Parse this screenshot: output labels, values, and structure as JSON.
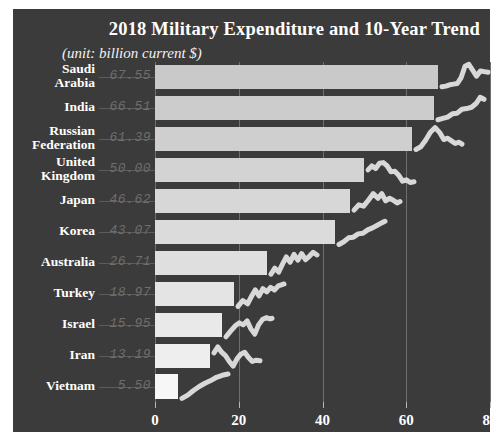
{
  "figure": {
    "title": "2018 Military Expenditure and 10-Year Trend",
    "subtitle": "(unit: billion current $)",
    "background_color": "#3b3b3b",
    "text_color": "#ffffff",
    "gridline_color": "#6f6f6f",
    "value_label_color": "#6e6e6e",
    "sparkline_color": "#d8d8d8"
  },
  "chart_data": {
    "type": "bar",
    "title": "2018 Military Expenditure and 10-Year Trend",
    "subtitle": "(unit: billion current $)",
    "xlabel": "",
    "ylabel": "",
    "unit": "billion current $",
    "orientation": "horizontal",
    "grid": true,
    "legend": "none",
    "xlim": [
      0,
      80
    ],
    "xticks": [
      0,
      20,
      40,
      60,
      80
    ],
    "xticklabels": [
      "0",
      "20",
      "40",
      "60",
      "80"
    ],
    "categories": [
      "Saudi Arabia",
      "India",
      "Russian Federation",
      "United Kingdom",
      "Japan",
      "Korea",
      "Australia",
      "Turkey",
      "Israel",
      "Iran",
      "Vietnam"
    ],
    "values": [
      67.55,
      66.51,
      61.39,
      50.0,
      46.62,
      43.07,
      26.71,
      18.97,
      15.95,
      13.19,
      5.5
    ],
    "value_labels": [
      "67.55",
      "66.51",
      "61.39",
      "50.00",
      "46.62",
      "43.07",
      "26.71",
      "18.97",
      "15.95",
      "13.19",
      "5.50"
    ],
    "bar_colors": [
      "#c9c9c9",
      "#cccccc",
      "#cfcfcf",
      "#d3d3d3",
      "#d7d7d7",
      "#dbdbdb",
      "#dfdfdf",
      "#e4e4e4",
      "#e9e9e9",
      "#eeeeee",
      "#f7f7f7"
    ],
    "sparklines": [
      {
        "country": "Saudi Arabia",
        "points": "0,72 8,70 16,66 24,64 32,62 40,44 48,10 56,4 64,22 72,40 80,24 88,26 96,28"
      },
      {
        "country": "India",
        "points": "0,78 10,74 20,70 30,60 40,58 50,46 60,44 70,40 80,28 88,10 96,16"
      },
      {
        "country": "Russian Federation",
        "points": "0,74 10,66 20,46 30,22 40,8 50,24 58,44 66,40 74,48 82,56 90,52 96,58"
      },
      {
        "country": "United Kingdom",
        "points": "0,42 8,30 16,38 24,22 32,20 40,30 48,48 56,46 64,58 72,76 80,72 88,80 96,78"
      },
      {
        "country": "Japan",
        "points": "0,70 10,54 20,58 30,40 40,20 50,34 58,20 66,42 74,34 82,40 90,48 96,44"
      },
      {
        "country": "Korea",
        "points": "0,80 10,72 20,60 30,58 40,48 50,46 60,36 70,30 80,22 90,14 96,10"
      },
      {
        "country": "Australia",
        "points": "0,76 8,58 16,70 24,46 32,24 40,40 48,16 56,34 64,14 72,32 80,22 88,10 96,18"
      },
      {
        "country": "Turkey",
        "points": "0,80 10,62 20,72 28,50 36,30 44,48 52,26 60,36 68,22 76,30 84,18 92,14 96,12"
      },
      {
        "country": "Israel",
        "points": "0,78 10,60 20,44 28,36 36,42 44,30 52,54 60,70 68,42 76,26 84,20 92,24 96,22"
      },
      {
        "country": "Iran",
        "points": "0,36 8,18 16,34 24,44 32,62 40,76 48,54 56,40 64,34 72,50 80,62 88,58 96,60"
      },
      {
        "country": "Vietnam",
        "points": "0,80 12,70 24,56 36,44 48,34 60,26 72,16 84,10 96,6"
      }
    ]
  },
  "rows": [
    {
      "label_line1": "Saudi",
      "label_line2": "Arabia"
    },
    {
      "label_line1": "India",
      "label_line2": ""
    },
    {
      "label_line1": "Russian",
      "label_line2": "Federation"
    },
    {
      "label_line1": "United",
      "label_line2": "Kingdom"
    },
    {
      "label_line1": "Japan",
      "label_line2": ""
    },
    {
      "label_line1": "Korea",
      "label_line2": ""
    },
    {
      "label_line1": "Australia",
      "label_line2": ""
    },
    {
      "label_line1": "Turkey",
      "label_line2": ""
    },
    {
      "label_line1": "Israel",
      "label_line2": ""
    },
    {
      "label_line1": "Iran",
      "label_line2": ""
    },
    {
      "label_line1": "Vietnam",
      "label_line2": ""
    }
  ]
}
